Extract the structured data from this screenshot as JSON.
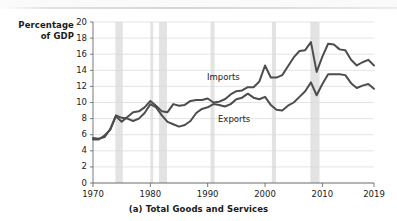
{
  "figure": {
    "caption": "(a) Total Goods and Services",
    "y_axis_title_line1": "Percentage",
    "y_axis_title_line2": "of GDP"
  },
  "labels": {
    "imports": "Imports",
    "exports": "Exports"
  },
  "colors": {
    "line": "#4d4d4d",
    "recession_band": "#e3e3e3",
    "gridline": "#d9d9d9",
    "axis": "#6b6b6b",
    "text": "#1a1a1a",
    "background": "#ffffff"
  },
  "chart_data": {
    "type": "line",
    "title": "(a) Total Goods and Services",
    "xlabel": "",
    "ylabel": "Percentage of GDP",
    "xlim": [
      1970,
      2019
    ],
    "ylim": [
      0,
      20
    ],
    "ytick_labels": [
      "0",
      "2",
      "4",
      "6",
      "8",
      "10",
      "12",
      "14",
      "16",
      "18",
      "20"
    ],
    "yticks": [
      0,
      2,
      4,
      6,
      8,
      10,
      12,
      14,
      16,
      18,
      20
    ],
    "xtick_labels": [
      "1970",
      "1980",
      "1990",
      "2000",
      "2010",
      "2019"
    ],
    "xticks": [
      1970,
      1980,
      1990,
      2000,
      2010,
      2019
    ],
    "grid": true,
    "legend": "inline-annotations",
    "x": [
      1970,
      1971,
      1972,
      1973,
      1974,
      1975,
      1976,
      1977,
      1978,
      1979,
      1980,
      1981,
      1982,
      1983,
      1984,
      1985,
      1986,
      1987,
      1988,
      1989,
      1990,
      1991,
      1992,
      1993,
      1994,
      1995,
      1996,
      1997,
      1998,
      1999,
      2000,
      2001,
      2002,
      2003,
      2004,
      2005,
      2006,
      2007,
      2008,
      2009,
      2010,
      2011,
      2012,
      2013,
      2014,
      2015,
      2016,
      2017,
      2018,
      2019
    ],
    "series": [
      {
        "name": "Imports",
        "values": [
          5.4,
          5.4,
          5.9,
          6.6,
          8.3,
          7.6,
          8.2,
          8.8,
          8.9,
          9.4,
          10.2,
          9.6,
          8.9,
          8.8,
          9.8,
          9.6,
          9.7,
          10.2,
          10.3,
          10.3,
          10.5,
          10.0,
          10.1,
          10.4,
          11.0,
          11.4,
          11.5,
          11.9,
          11.9,
          12.6,
          14.6,
          13.1,
          13.1,
          13.4,
          14.5,
          15.6,
          16.4,
          16.5,
          17.5,
          13.8,
          15.7,
          17.3,
          17.2,
          16.6,
          16.5,
          15.3,
          14.6,
          15.0,
          15.3,
          14.6
        ]
      },
      {
        "name": "Exports",
        "values": [
          5.6,
          5.5,
          5.7,
          6.7,
          8.4,
          8.1,
          8.0,
          7.7,
          8.0,
          8.7,
          9.8,
          9.4,
          8.4,
          7.6,
          7.3,
          7.0,
          7.2,
          7.7,
          8.7,
          9.2,
          9.4,
          9.8,
          9.7,
          9.5,
          9.8,
          10.4,
          10.6,
          11.1,
          10.6,
          10.4,
          10.7,
          9.7,
          9.1,
          9.0,
          9.6,
          10.0,
          10.7,
          11.4,
          12.5,
          10.9,
          12.3,
          13.5,
          13.5,
          13.5,
          13.4,
          12.4,
          11.8,
          12.1,
          12.3,
          11.7
        ]
      }
    ],
    "recessions": [
      {
        "start": 1973.9,
        "end": 1975.2
      },
      {
        "start": 1980.0,
        "end": 1980.5
      },
      {
        "start": 1981.5,
        "end": 1982.9
      },
      {
        "start": 1990.5,
        "end": 1991.2
      },
      {
        "start": 2001.2,
        "end": 2001.9
      },
      {
        "start": 2007.9,
        "end": 2009.5
      }
    ]
  }
}
